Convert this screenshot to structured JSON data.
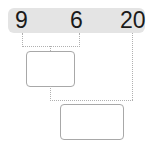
{
  "numbers": {
    "n1": "9",
    "n2": "6",
    "n3": "20"
  },
  "colors": {
    "bar": "#e4e4e4",
    "line": "#b0b0b0",
    "box_border": "#a8a8a8"
  },
  "boxes": [
    {
      "id": "box1",
      "value": ""
    },
    {
      "id": "box2",
      "value": ""
    }
  ]
}
